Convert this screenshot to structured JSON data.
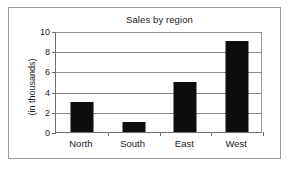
{
  "chart_data": {
    "type": "bar",
    "title": "Sales by region",
    "xlabel": "",
    "ylabel": "(in thousands)",
    "categories": [
      "North",
      "South",
      "East",
      "West"
    ],
    "values": [
      3,
      1,
      5,
      9
    ],
    "ylim": [
      0,
      10
    ],
    "yticks": [
      0,
      2,
      4,
      6,
      8,
      10
    ],
    "grid": true,
    "legend": false,
    "bar_color": "#0d0d0d",
    "grid_color": "#8c8c8c",
    "axis_color": "#6e6e6e",
    "background": "#ffffff"
  }
}
